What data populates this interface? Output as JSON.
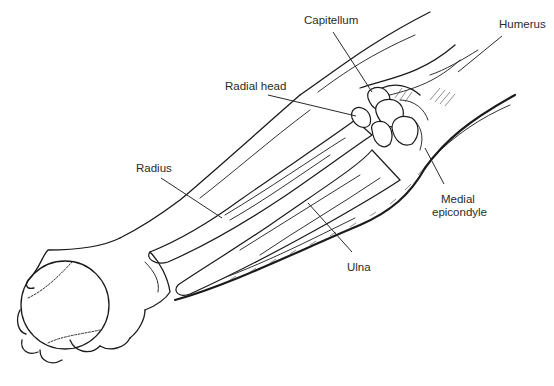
{
  "figure": {
    "labels": {
      "capitellum": "Capitellum",
      "humerus": "Humerus",
      "radial_head": "Radial head",
      "medial_epicondyle_line1": "Medial",
      "medial_epicondyle_line2": "epicondyle",
      "radius": "Radius",
      "ulna": "Ulna"
    }
  }
}
